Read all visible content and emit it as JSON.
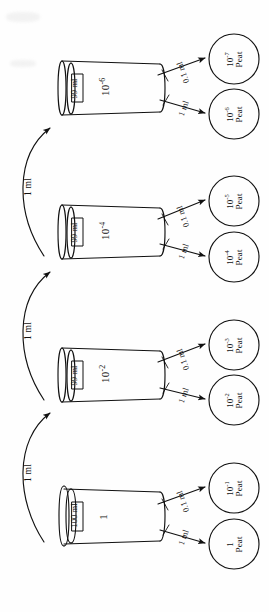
{
  "figure": {
    "type": "serial-dilution-diagram",
    "orientation": "rotated-90-ccw",
    "background_color": "#fefefe",
    "line_color": "#111111"
  },
  "flasks": [
    {
      "id": "flask-1",
      "concentration": "1",
      "volume": "100 ml",
      "pipette_out": [
        {
          "label": "1 ml",
          "target": "dish-1"
        },
        {
          "label": "0.1 ml",
          "target": "dish-2"
        }
      ]
    },
    {
      "id": "flask-2",
      "concentration_base": "10",
      "concentration_exp": "-2",
      "volume": "99 ml",
      "pipette_out": [
        {
          "label": "1 ml",
          "target": "dish-3"
        },
        {
          "label": "0.1 ml",
          "target": "dish-4"
        }
      ]
    },
    {
      "id": "flask-3",
      "concentration_base": "10",
      "concentration_exp": "-4",
      "volume": "99 ml",
      "pipette_out": [
        {
          "label": "1 ml",
          "target": "dish-5"
        },
        {
          "label": "0.1 ml",
          "target": "dish-6"
        }
      ]
    },
    {
      "id": "flask-4",
      "concentration_base": "10",
      "concentration_exp": "-6",
      "volume": "99 ml",
      "pipette_out": [
        {
          "label": "1 ml",
          "target": "dish-7"
        },
        {
          "label": "0.1 ml",
          "target": "dish-8"
        }
      ]
    }
  ],
  "transfers": [
    {
      "id": "transfer-1",
      "label": "1 ml",
      "from": "flask-1",
      "to": "flask-2"
    },
    {
      "id": "transfer-2",
      "label": "1 ml",
      "from": "flask-2",
      "to": "flask-3"
    },
    {
      "id": "transfer-3",
      "label": "1 ml",
      "from": "flask-3",
      "to": "flask-4"
    }
  ],
  "dishes": [
    {
      "id": "dish-1",
      "concentration": "1",
      "exp": "",
      "medium": "Peat"
    },
    {
      "id": "dish-2",
      "concentration": "10",
      "exp": "-1",
      "medium": "Peat"
    },
    {
      "id": "dish-3",
      "concentration": "10",
      "exp": "-2",
      "medium": "Peat"
    },
    {
      "id": "dish-4",
      "concentration": "10",
      "exp": "-3",
      "medium": "Peat"
    },
    {
      "id": "dish-5",
      "concentration": "10",
      "exp": "-4",
      "medium": "Peat"
    },
    {
      "id": "dish-6",
      "concentration": "10",
      "exp": "-5",
      "medium": "Peat"
    },
    {
      "id": "dish-7",
      "concentration": "10",
      "exp": "-6",
      "medium": "Peat"
    },
    {
      "id": "dish-8",
      "concentration": "10",
      "exp": "-7",
      "medium": "Peat"
    }
  ]
}
